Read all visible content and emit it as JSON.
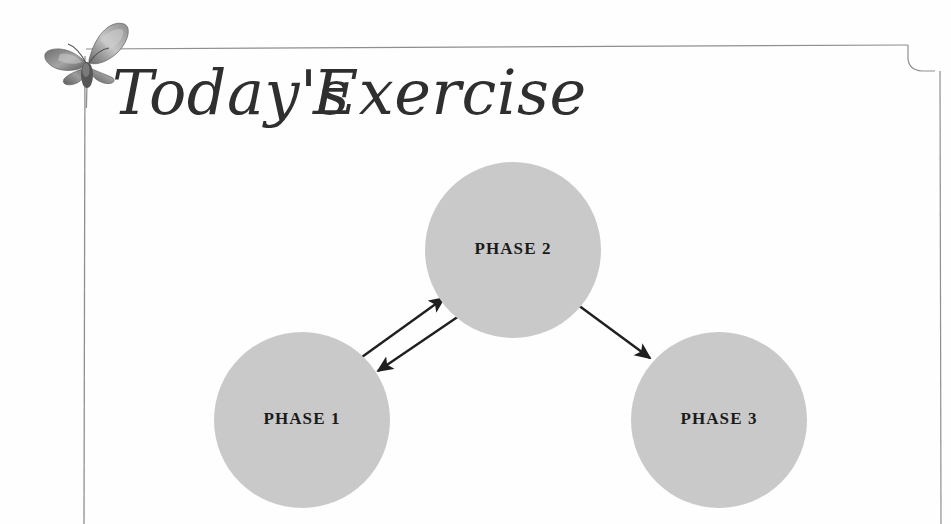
{
  "page": {
    "background_color": "#fefefe",
    "width": 951,
    "height": 524
  },
  "ornament": {
    "butterfly_icon": "butterfly-icon",
    "color_dark": "#4a4a4a",
    "color_light": "#b9b9b9"
  },
  "border": {
    "color": "#8f8f8f",
    "style": "thin-rule-frame-with-notched-top-right-corner"
  },
  "title": {
    "text": "Today's Exercise",
    "word_1": "Today's",
    "word_2": "Exercise",
    "color": "#2f2f2f",
    "style": "calligraphic-script"
  },
  "diagram": {
    "type": "cycle-flow",
    "node_fill": "#c9c9c9",
    "arrow_color": "#1f1f1f",
    "label_color": "#1a1a1a",
    "nodes": [
      {
        "id": "phase-1",
        "label": "PHASE 1",
        "cx": 302,
        "cy": 420,
        "r": 88
      },
      {
        "id": "phase-2",
        "label": "PHASE 2",
        "cx": 513,
        "cy": 250,
        "r": 88
      },
      {
        "id": "phase-3",
        "label": "PHASE 3",
        "cx": 719,
        "cy": 420,
        "r": 88
      }
    ],
    "edges": [
      {
        "id": "edge-p1-to-p2",
        "from": "phase-1",
        "to": "phase-2",
        "direction": "forward"
      },
      {
        "id": "edge-p2-to-p1",
        "from": "phase-2",
        "to": "phase-1",
        "direction": "return"
      },
      {
        "id": "edge-p2-to-p3",
        "from": "phase-2",
        "to": "phase-3",
        "direction": "forward"
      }
    ]
  }
}
